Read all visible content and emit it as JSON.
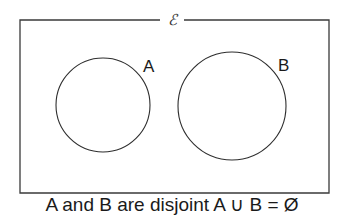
{
  "diagram": {
    "type": "venn",
    "universe": {
      "symbol": "ℰ",
      "x": 20,
      "y": 20,
      "width": 309,
      "height": 173
    },
    "sets": [
      {
        "label": "A",
        "cx": 103,
        "cy": 105,
        "r": 47,
        "label_x": 143,
        "label_y": 72
      },
      {
        "label": "B",
        "cx": 232,
        "cy": 106,
        "r": 54,
        "label_x": 278,
        "label_y": 71
      }
    ],
    "relationship": "disjoint",
    "caption": "A and B are disjoint A ∪ B = Ø"
  }
}
